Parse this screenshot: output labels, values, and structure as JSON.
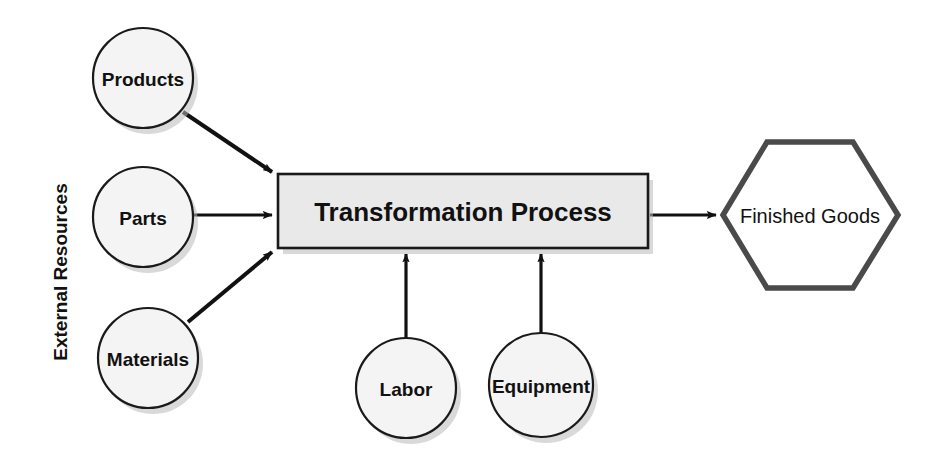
{
  "diagram": {
    "background_color": "#ffffff",
    "group_label": "External Resources",
    "inputs": [
      {
        "label": "Products",
        "shape": "circle",
        "cx": 143,
        "cy": 78,
        "r": 50
      },
      {
        "label": "Parts",
        "shape": "circle",
        "cx": 143,
        "cy": 217,
        "r": 50
      },
      {
        "label": "Materials",
        "shape": "circle",
        "cx": 148,
        "cy": 358,
        "r": 50
      }
    ],
    "resources": [
      {
        "label": "Labor",
        "shape": "circle",
        "cx": 406,
        "cy": 388,
        "r": 50
      },
      {
        "label": "Equipment",
        "shape": "circle",
        "cx": 541,
        "cy": 385,
        "r": 52
      }
    ],
    "process": {
      "label": "Transformation Process",
      "shape": "rectangle",
      "x": 278,
      "y": 174,
      "width": 370,
      "height": 74,
      "fill": "#e9e9e9",
      "stroke": "#1a1a1a"
    },
    "output": {
      "label": "Finished Goods",
      "shape": "hexagon",
      "cx": 810,
      "cy": 215,
      "width": 176,
      "height": 150,
      "fill": "#ffffff",
      "stroke": "#4a4a4a"
    },
    "connectors": [
      {
        "from": "Products",
        "to": "Transformation Process",
        "style": "diagonal-down-right"
      },
      {
        "from": "Parts",
        "to": "Transformation Process",
        "style": "horizontal-right"
      },
      {
        "from": "Materials",
        "to": "Transformation Process",
        "style": "diagonal-up-right"
      },
      {
        "from": "Labor",
        "to": "Transformation Process",
        "style": "vertical-up"
      },
      {
        "from": "Equipment",
        "to": "Transformation Process",
        "style": "vertical-up"
      },
      {
        "from": "Transformation Process",
        "to": "Finished Goods",
        "style": "horizontal-right"
      }
    ]
  }
}
